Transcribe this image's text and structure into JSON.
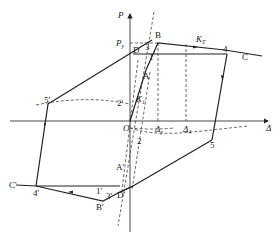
{
  "diagram": {
    "type": "hysteresis-loop",
    "axes": {
      "x_label": "Δ",
      "y_label": "P",
      "origin_label": "O"
    },
    "level_labels": {
      "py": "P",
      "py_sub": "y",
      "kt": "K",
      "kt_sub": "T",
      "k1": "K",
      "k1_sub": "1",
      "dy": "Δ",
      "dy_sub": "y",
      "d4": "Δ",
      "d4_sub": "4"
    },
    "point_labels": {
      "A": "A",
      "B": "B",
      "C": "C",
      "D": "D",
      "p1": "1",
      "p2": "2",
      "p3": "3",
      "p4": "4",
      "p5": "5",
      "A_p": "A'",
      "B_p": "B'",
      "C_p": "C'",
      "D_p": "D'",
      "p1_p": "1'",
      "p2_p": "2'",
      "p3_p": "3'",
      "p4_p": "4'",
      "p5_p": "5'"
    },
    "colors": {
      "line": "#222222",
      "dashed": "#444444"
    }
  }
}
